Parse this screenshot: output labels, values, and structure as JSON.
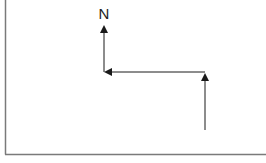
{
  "diagram": {
    "north_label": "N",
    "colors": {
      "background": "#ffffff",
      "frame": "#7a7a7a",
      "arrow": "#1a1a1a"
    },
    "frame": {
      "left": 5,
      "bottom": 154
    },
    "path": [
      {
        "from": [
          205,
          130
        ],
        "to": [
          205,
          73
        ],
        "direction": "north"
      },
      {
        "from": [
          205,
          72
        ],
        "to": [
          105,
          72
        ],
        "direction": "west"
      },
      {
        "from": [
          104,
          72
        ],
        "to": [
          104,
          26
        ],
        "direction": "north"
      }
    ]
  }
}
